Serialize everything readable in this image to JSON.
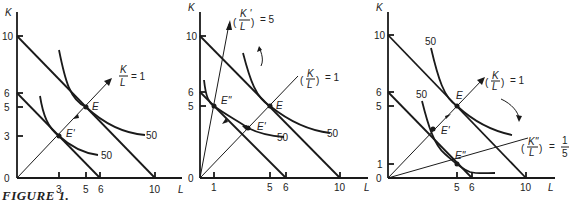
{
  "caption": "FIGURE 1.",
  "axis_labels": {
    "y": "K",
    "x": "L"
  },
  "panels": [
    {
      "y_ticks": [
        "10",
        "6",
        "5",
        "3",
        "0"
      ],
      "x_ticks": [
        "3",
        "5",
        "6",
        "10"
      ],
      "points": [
        "E",
        "E'"
      ],
      "isoquant_labels": [
        "50",
        "50"
      ],
      "ray_label": {
        "num": "K",
        "den": "L",
        "value": "= 1"
      }
    },
    {
      "y_ticks": [
        "10",
        "6",
        "5",
        "0"
      ],
      "x_ticks": [
        "1",
        "5",
        "6",
        "10"
      ],
      "points": [
        "E",
        "E'",
        "E\""
      ],
      "isoquant_labels": [
        "50",
        "50"
      ],
      "ray_label_1": {
        "num": "K",
        "den": "L",
        "value": "= 1"
      },
      "ray_label_2": {
        "num": "K '",
        "den": "L",
        "value": "= 5"
      }
    },
    {
      "y_ticks": [
        "10",
        "6",
        "5",
        "1",
        "0"
      ],
      "x_ticks": [
        "5",
        "6",
        "10"
      ],
      "points": [
        "E",
        "E'",
        "E\""
      ],
      "isoquant_labels": [
        "50",
        "50"
      ],
      "ray_label_1": {
        "num": "K",
        "den": "L",
        "value": "= 1"
      },
      "ray_label_2": {
        "num": "K\"",
        "den": "L",
        "value": "=",
        "frac_num": "1",
        "frac_den": "5"
      }
    }
  ]
}
